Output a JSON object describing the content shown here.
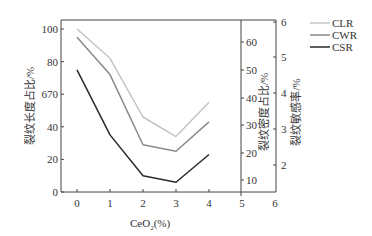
{
  "chart_data": {
    "type": "line",
    "title": "",
    "xlabel": "CeO2(%)",
    "xlabel_main": "CeO",
    "xlabel_sub": "2",
    "xlabel_suffix": "(%)",
    "x": [
      0,
      1,
      2,
      3,
      4
    ],
    "x_ticks": [
      "0",
      "1",
      "2",
      "3",
      "4",
      "5",
      "6"
    ],
    "xlim": [
      -0.5,
      6
    ],
    "ylabel_left": "裂纹长度占比/%",
    "ylabel_inner_right": "裂纹密度占比/%",
    "ylabel_outer_right": "裂纹敏感率/%",
    "y_left_ticks": [
      "0",
      "20",
      "40",
      "670",
      "80",
      "100"
    ],
    "y_left_tick_values": [
      0,
      20,
      40,
      60,
      80,
      100
    ],
    "ylim_left": [
      0,
      100
    ],
    "y_inner_right_ticks": [
      "10",
      "20",
      "30",
      "40",
      "50",
      "60"
    ],
    "y_outer_right_ticks": [
      "2",
      "3",
      "4",
      "5",
      "6"
    ],
    "grid": false,
    "legend_position": "upper right, outside",
    "series": [
      {
        "name": "CLR",
        "color": "#c4c4c4",
        "values": [
          100,
          82,
          46,
          34,
          55
        ]
      },
      {
        "name": "CWR",
        "color": "#8a8a8a",
        "values": [
          95,
          72,
          29,
          25,
          43
        ]
      },
      {
        "name": "CSR",
        "color": "#2a2a2a",
        "values": [
          75,
          35,
          10,
          6,
          23
        ]
      }
    ]
  }
}
